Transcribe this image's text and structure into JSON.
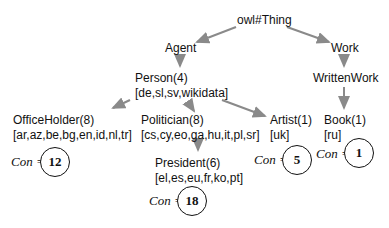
{
  "diagram": {
    "type": "ontology-tree",
    "root": "owl#Thing",
    "nodes": {
      "thing": {
        "label": "owl#Thing"
      },
      "agent": {
        "label": "Agent"
      },
      "work": {
        "label": "Work"
      },
      "person": {
        "label": "Person(4)",
        "langs": "[de,sl,sv,wikidata]"
      },
      "writtenwork": {
        "label": "WrittenWork"
      },
      "officeholder": {
        "label": "OfficeHolder(8)",
        "langs": "[ar,az,be,bg,en,id,nl,tr]",
        "con_label": "Con =",
        "con_value": "12"
      },
      "politician": {
        "label": "Politician(8)",
        "langs": "[cs,cy,eo,ga,hu,it,pl,sr]"
      },
      "artist": {
        "label": "Artist(1)",
        "langs": "[uk]",
        "con_label": "Con =",
        "con_value": "5"
      },
      "book": {
        "label": "Book(1)",
        "langs": "[ru]",
        "con_label": "Con =",
        "con_value": "1"
      },
      "president": {
        "label": "President(6)",
        "langs": "[el,es,eu,fr,ko,pt]",
        "con_label": "Con =",
        "con_value": "18"
      }
    },
    "edges": [
      [
        "owl#Thing",
        "Agent"
      ],
      [
        "owl#Thing",
        "Work"
      ],
      [
        "Agent",
        "Person"
      ],
      [
        "Work",
        "WrittenWork"
      ],
      [
        "Person",
        "OfficeHolder"
      ],
      [
        "Person",
        "Politician"
      ],
      [
        "Person",
        "Artist"
      ],
      [
        "WrittenWork",
        "Book"
      ],
      [
        "Politician",
        "President"
      ]
    ],
    "colors": {
      "edge": "#8a8a8a",
      "text": "#111111",
      "background": "#ffffff"
    }
  }
}
